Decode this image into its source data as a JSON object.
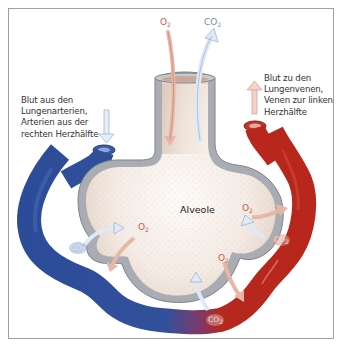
{
  "diagram": {
    "title": "Alveole",
    "captions": {
      "left": {
        "lines": [
          "Blut aus den",
          "Lungenarterien,",
          "Arterien aus der",
          "rechten Herzhälfte"
        ]
      },
      "right": {
        "lines": [
          "Blut zu den",
          "Lungenvenen,",
          "Venen zur linken",
          "Herzhälfte"
        ]
      }
    },
    "gas_labels": {
      "top_o2": {
        "base": "O",
        "sub": "2"
      },
      "top_co2": {
        "base": "CO",
        "sub": "2"
      },
      "left_o2": {
        "base": "O",
        "sub": "2"
      },
      "left_co2": {
        "base": "CO",
        "sub": "2"
      },
      "right_o2": {
        "base": "O",
        "sub": "2"
      },
      "right_co2": {
        "base": "CO",
        "sub": "2"
      },
      "bottom_o2": {
        "base": "O",
        "sub": "2"
      },
      "bottom_co2": {
        "base": "CO",
        "sub": "2"
      }
    },
    "colors": {
      "deoxygenated_blood": "#2f4f9a",
      "oxygenated_blood": "#b8261c",
      "alveolar_wall": "#a9adb3",
      "alveolar_interior": "#f3e9e1",
      "o2_arrow": "#e8b6a6",
      "co2_arrow": "#dfeaf6",
      "frame_border": "#9a9faa"
    }
  }
}
